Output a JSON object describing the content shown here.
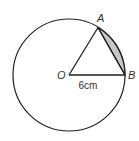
{
  "diagram": {
    "labels": {
      "center": "O",
      "point_a": "A",
      "point_b": "B",
      "radius_measure": "6cm"
    },
    "colors": {
      "stroke": "#222222",
      "segment_fill": "#c8c8c8",
      "background": "#ffffff"
    }
  }
}
